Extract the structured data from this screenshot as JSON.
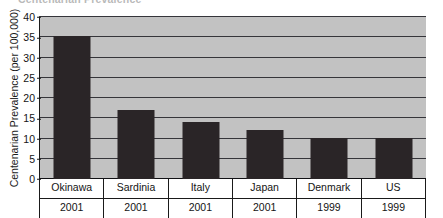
{
  "figure": {
    "title_remnant": "Centenarian Prevalence",
    "background_color": "#ffffff",
    "plot_background_color": "#c2c2c2",
    "bar_color": "#2a2527",
    "gridline_color": "#35353a",
    "axis_color": "#1a1a1a"
  },
  "chart_data": {
    "type": "bar",
    "title": "",
    "xlabel": "",
    "ylabel": "Centenarian Prevalence (per 100,000)",
    "categories": [
      "Okinawa",
      "Sardinia",
      "Italy",
      "Japan",
      "Denmark",
      "US"
    ],
    "years": [
      "2001",
      "2001",
      "2001",
      "2001",
      "1999",
      "1999"
    ],
    "values": [
      35,
      17,
      14,
      12,
      10,
      10
    ],
    "ylim": [
      0,
      40
    ],
    "yticks": [
      0,
      5,
      10,
      15,
      20,
      25,
      30,
      35,
      40
    ],
    "ytick_labels": [
      "0",
      "5",
      "10",
      "15",
      "20",
      "25",
      "30",
      "35",
      "40"
    ],
    "grid": true,
    "legend": false,
    "legend_position": "none"
  }
}
